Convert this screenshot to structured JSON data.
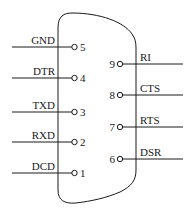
{
  "diagram": {
    "type": "DB9 serial connector pinout",
    "left_pins": [
      {
        "number": "5",
        "signal": "GND",
        "y": 47
      },
      {
        "number": "4",
        "signal": "DTR",
        "y": 78
      },
      {
        "number": "3",
        "signal": "TXD",
        "y": 112
      },
      {
        "number": "2",
        "signal": "RXD",
        "y": 142
      },
      {
        "number": "1",
        "signal": "DCD",
        "y": 173
      }
    ],
    "right_pins": [
      {
        "number": "9",
        "signal": "RI",
        "y": 64
      },
      {
        "number": "8",
        "signal": "CTS",
        "y": 95
      },
      {
        "number": "7",
        "signal": "RTS",
        "y": 127
      },
      {
        "number": "6",
        "signal": "DSR",
        "y": 159
      }
    ],
    "colors": {
      "stroke": "#1a1a1a",
      "background": "#ffffff"
    }
  }
}
